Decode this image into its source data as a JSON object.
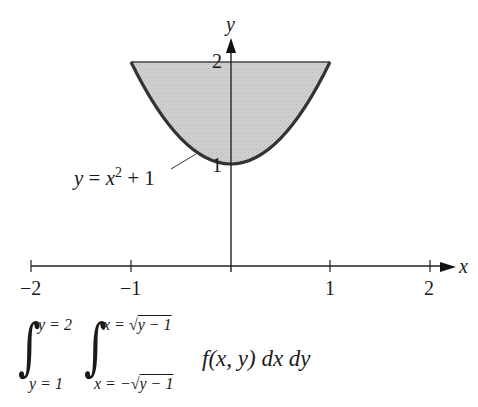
{
  "diagram": {
    "axes": {
      "x_label": "x",
      "y_label": "y",
      "x_ticks": [
        {
          "value": -2,
          "label": "−2"
        },
        {
          "value": -1,
          "label": "−1"
        },
        {
          "value": 1,
          "label": "1"
        },
        {
          "value": 2,
          "label": "2"
        }
      ],
      "y_ticks": [
        {
          "value": 1,
          "label": "1"
        },
        {
          "value": 2,
          "label": "2"
        }
      ]
    },
    "curve": {
      "equation_label": "y = x² + 1",
      "lhs": "y",
      "eq": " = ",
      "var": "x",
      "sup": "2",
      "rest": " + 1"
    },
    "region": {
      "description": "Region between y = x^2 + 1 and y = 2",
      "fill_color": "#c8c8c8",
      "curve_color": "#333333"
    },
    "integral": {
      "outer_upper": "y = 2",
      "outer_lower": "y = 1",
      "inner_upper_prefix": "x = ",
      "inner_upper_radicand": "y − 1",
      "inner_lower_prefix": "x = −",
      "inner_lower_radicand": "y − 1",
      "integrand": "f(x, y) dx dy",
      "sign": "∫",
      "sqrt": "√"
    }
  }
}
